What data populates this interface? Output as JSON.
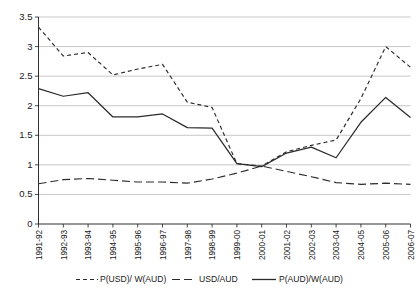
{
  "chart_data": {
    "type": "line",
    "title": "",
    "subtitle": "",
    "xlabel": "",
    "ylabel": "",
    "ylim": [
      0,
      3.5
    ],
    "ytick_step": 0.5,
    "yticks": [
      "0",
      "0.5",
      "1",
      "1.5",
      "2",
      "2.5",
      "3",
      "3.5"
    ],
    "grid": true,
    "legend_position": "bottom",
    "categories": [
      "1991-92",
      "1992-93",
      "1993-94",
      "1994-95",
      "1995-96",
      "1996-97",
      "1997-98",
      "1998-99",
      "1999-00",
      "2000-01",
      "2001-02",
      "2002-03",
      "2003-04",
      "2004-05",
      "2005-06",
      "2006-07"
    ],
    "series": [
      {
        "name": "P(USD)/ W(AUD)",
        "style": "short-dash",
        "color": "#2b2b2b",
        "values": [
          3.33,
          2.84,
          2.9,
          2.52,
          2.62,
          2.7,
          2.06,
          1.97,
          1.02,
          0.98,
          1.22,
          1.33,
          1.42,
          2.12,
          3.0,
          2.65
        ]
      },
      {
        "name": "USD/AUD",
        "style": "long-dash",
        "color": "#2b2b2b",
        "values": [
          0.68,
          0.75,
          0.77,
          0.74,
          0.71,
          0.71,
          0.69,
          0.76,
          0.86,
          0.98,
          0.89,
          0.8,
          0.7,
          0.67,
          0.69,
          0.67
        ]
      },
      {
        "name": "P(AUD)/W(AUD)",
        "style": "solid",
        "color": "#2b2b2b",
        "values": [
          2.29,
          2.16,
          2.22,
          1.81,
          1.81,
          1.86,
          1.63,
          1.62,
          1.02,
          0.97,
          1.2,
          1.3,
          1.12,
          1.72,
          2.14,
          1.8
        ]
      }
    ]
  },
  "legend": {
    "items": [
      {
        "label": "P(USD)/ W(AUD)"
      },
      {
        "label": "USD/AUD"
      },
      {
        "label": "P(AUD)/W(AUD)"
      }
    ]
  }
}
